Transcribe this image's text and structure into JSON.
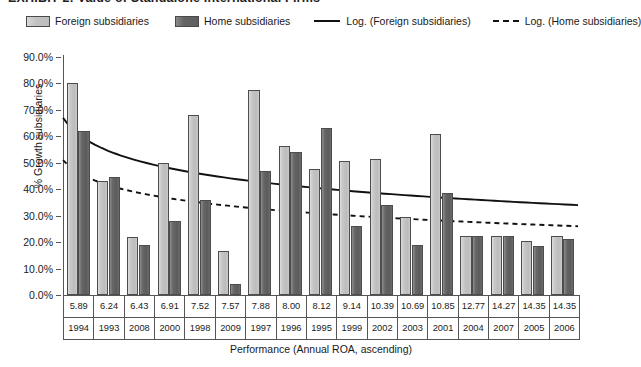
{
  "figure": {
    "title_cropped": "EXHIBIT 2:  Value of Standalone International Firms",
    "x_axis_title": "Performance (Annual ROA, ascending)",
    "y_axis_title": "% Growth subsidiaries"
  },
  "legend": {
    "items": [
      {
        "label": "Foreign subsidiaries",
        "marker": "swatch-light",
        "color": "#c2c2c2"
      },
      {
        "label": "Home subsidiaries",
        "marker": "swatch-dark",
        "color": "#646464"
      },
      {
        "label": "Log. (Foreign subsidiaries)",
        "marker": "solid-line",
        "color": "#111111"
      },
      {
        "label": "Log. (Home subsidiaries)",
        "marker": "dashed-line",
        "color": "#111111"
      }
    ]
  },
  "y_ticks": [
    "0.0%",
    "10.0%",
    "20.0%",
    "30.0%",
    "40.0%",
    "50.0%",
    "60.0%",
    "70.0%",
    "80.0%",
    "90.0%"
  ],
  "chart_data": {
    "type": "bar",
    "title": "EXHIBIT 2:  Value of Standalone International Firms",
    "xlabel": "Performance (Annual ROA, ascending)",
    "ylabel": "% Growth subsidiaries",
    "ylim": [
      0,
      90
    ],
    "ytick_step": 10,
    "grid": false,
    "legend_position": "top",
    "categories": [
      "5.89",
      "6.24",
      "6.43",
      "6.91",
      "7.52",
      "7.57",
      "7.88",
      "8.00",
      "8.12",
      "9.14",
      "10.39",
      "10.69",
      "10.85",
      "12.77",
      "14.27",
      "14.35",
      "14.35"
    ],
    "categories_secondary": [
      "1994",
      "1993",
      "2008",
      "2000",
      "1998",
      "2009",
      "1997",
      "1996",
      "1995",
      "1999",
      "2002",
      "2003",
      "2001",
      "2004",
      "2007",
      "2005",
      "2006"
    ],
    "category_axis_rows": [
      "roa",
      "year"
    ],
    "series": [
      {
        "name": "Foreign subsidiaries",
        "color": "#c2c2c2",
        "values": [
          80.0,
          43.0,
          22.0,
          50.0,
          68.0,
          16.5,
          77.5,
          56.5,
          47.5,
          50.5,
          51.5,
          29.5,
          61.0,
          22.5,
          22.5,
          20.5,
          22.5
        ]
      },
      {
        "name": "Home subsidiaries",
        "color": "#646464",
        "values": [
          62.0,
          44.5,
          19.0,
          28.0,
          36.0,
          4.0,
          47.0,
          54.0,
          63.0,
          26.0,
          34.0,
          19.0,
          38.5,
          22.5,
          22.5,
          18.5,
          21.0
        ]
      }
    ],
    "trendlines": [
      {
        "name": "Log. (Foreign subsidiaries)",
        "style": "solid",
        "color": "#111111",
        "start_value": 67.0,
        "end_value": 34.0
      },
      {
        "name": "Log. (Home subsidiaries)",
        "style": "dashed",
        "color": "#111111",
        "start_value": 51.0,
        "end_value": 26.0
      }
    ]
  }
}
